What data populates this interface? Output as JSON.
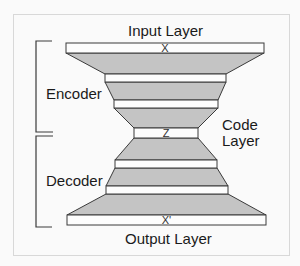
{
  "diagram": {
    "labels": {
      "input_layer": "Input Layer",
      "output_layer": "Output Layer",
      "encoder": "Encoder",
      "decoder": "Decoder",
      "code_layer_line1": "Code",
      "code_layer_line2": "Layer"
    },
    "layer_tags": {
      "input": "X",
      "code": "Z",
      "output": "X'"
    },
    "colors": {
      "background": "#fafafa",
      "frame_border": "#d8d8d8",
      "layer_fill": "#fdfdfd",
      "connection_fill": "#c4c4c4",
      "stroke": "#3a3a3a",
      "text": "#1a1a1a"
    },
    "layers": [
      {
        "name": "input",
        "tag": "X",
        "x1": 66,
        "x2": 264,
        "y1": 43,
        "y2": 53
      },
      {
        "name": "encoder-hidden-1",
        "tag": "",
        "x1": 105,
        "x2": 226,
        "y1": 74,
        "y2": 82
      },
      {
        "name": "encoder-hidden-2",
        "tag": "",
        "x1": 114,
        "x2": 218,
        "y1": 100,
        "y2": 108
      },
      {
        "name": "code",
        "tag": "Z",
        "x1": 134,
        "x2": 198,
        "y1": 128,
        "y2": 138
      },
      {
        "name": "decoder-hidden-1",
        "tag": "",
        "x1": 115,
        "x2": 217,
        "y1": 160,
        "y2": 168
      },
      {
        "name": "decoder-hidden-2",
        "tag": "",
        "x1": 106,
        "x2": 228,
        "y1": 186,
        "y2": 194
      },
      {
        "name": "output",
        "tag": "X'",
        "x1": 67,
        "x2": 266,
        "y1": 215,
        "y2": 225
      }
    ]
  }
}
